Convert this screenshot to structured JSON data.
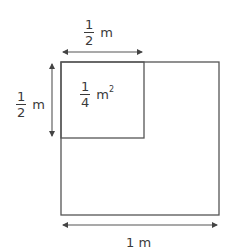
{
  "diagram": {
    "colors": {
      "stroke": "#555555",
      "text": "#3a3a3a",
      "background": "#ffffff"
    },
    "large_square": {
      "side_label": "1 m",
      "x": 61,
      "y": 62,
      "width": 158,
      "height": 153
    },
    "small_square": {
      "x": 61,
      "y": 62,
      "width": 83,
      "height": 76,
      "area_label": {
        "numerator": "1",
        "denominator": "4",
        "unit": "m",
        "exponent": "2"
      }
    },
    "dimensions": {
      "top": {
        "numerator": "1",
        "denominator": "2",
        "unit": "m"
      },
      "left": {
        "numerator": "1",
        "denominator": "2",
        "unit": "m"
      },
      "bottom": {
        "text": "1 m"
      }
    }
  }
}
